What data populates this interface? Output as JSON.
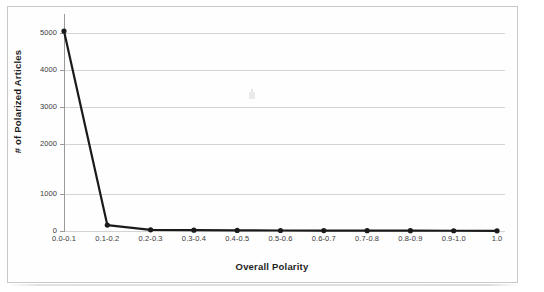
{
  "chart_data": {
    "type": "line",
    "title": "",
    "xlabel": "Overall Polarity",
    "ylabel": "# of Polarized Articles",
    "categories": [
      "0.0-0.1",
      "0.1-0.2",
      "0.2-0.3",
      "0.3-0.4",
      "0.4-0.5",
      "0.5-0.6",
      "0.6-0.7",
      "0.7-0.8",
      "0.8-0.9",
      "0.9-1.0",
      "1.0"
    ],
    "values": [
      5050,
      150,
      30,
      20,
      15,
      12,
      10,
      8,
      8,
      6,
      5
    ],
    "series": [
      {
        "name": "# of Polarized Articles",
        "values": [
          5050,
          150,
          30,
          20,
          15,
          12,
          10,
          8,
          8,
          6,
          5
        ]
      }
    ],
    "ylim": [
      0,
      5000
    ],
    "yticks": [
      0,
      1000,
      2000,
      3000,
      4000,
      5000
    ],
    "ytick_labels": [
      "0",
      "1000",
      "2000",
      "3000",
      "4000",
      "5000"
    ],
    "grid": true,
    "grid_axis": "y",
    "legend": false,
    "legend_position": "none",
    "marker": "circle",
    "line_color": "#1a1a1a",
    "marker_color": "#1a1a1a",
    "grid_color": "#d4d4d4",
    "axis_color": "#9a9a9a",
    "background_color": "#ffffff"
  },
  "axes": {
    "y_title": "# of Polarized Articles",
    "x_title": "Overall Polarity"
  }
}
